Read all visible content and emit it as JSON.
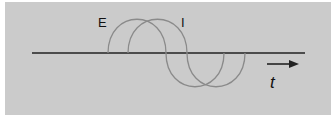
{
  "diagram": {
    "labels": {
      "voltage": "E",
      "current": "I",
      "time_axis": "t"
    },
    "colors": {
      "background": "#cbcbcb",
      "axis": "#222222",
      "curve": "#8a8a8a"
    }
  }
}
